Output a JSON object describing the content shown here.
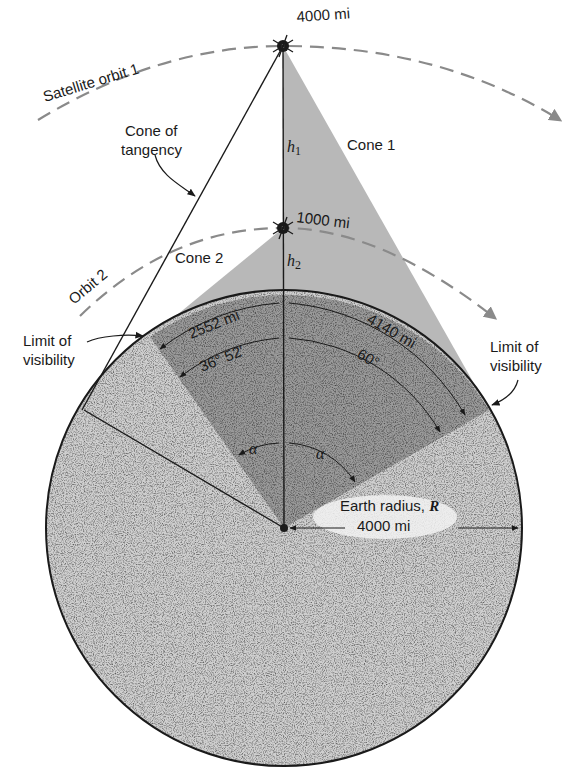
{
  "figure": {
    "orbits": {
      "orbit1_label": "Satellite orbit 1",
      "orbit2_label": "Orbit 2"
    },
    "satellites": {
      "sat1_altitude_label": "4000 mi",
      "sat2_altitude_label": "1000 mi"
    },
    "heights": {
      "h1_label": "h",
      "h1_sub": "1",
      "h2_label": "h",
      "h2_sub": "2"
    },
    "cones": {
      "cone1_label": "Cone 1",
      "cone2_label": "Cone 2",
      "tangency_label_line1": "Cone of",
      "tangency_label_line2": "tangency"
    },
    "visibility": {
      "left_line1": "Limit of",
      "left_line2": "visibility",
      "right_line1": "Limit of",
      "right_line2": "visibility"
    },
    "measurements": {
      "arc_cone2": "2552 mi",
      "angle_cone2": "36° 52′",
      "arc_cone1": "4140 mi",
      "angle_cone1": "60°",
      "alpha_left": "α",
      "alpha_right": "α"
    },
    "earth": {
      "radius_label_text": "Earth radius, ",
      "radius_symbol": "R",
      "radius_value": "4000 mi"
    },
    "colors": {
      "earth_light": "#c9c9c9",
      "earth_dark": "#8e8e8e",
      "cone_gray": "#b4b4b4",
      "orbit_dash": "#8a8a8a",
      "line": "#1a1a1a"
    }
  }
}
